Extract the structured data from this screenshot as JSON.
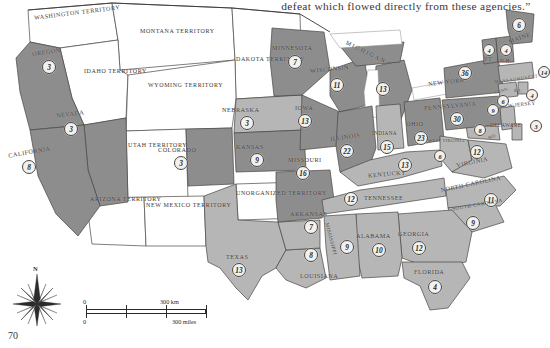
{
  "page": {
    "folio": "70",
    "quote": "defeat which flowed directly from these agencies.”"
  },
  "legend": {
    "compass_north": "N",
    "scale": {
      "km_zero": "0",
      "km_label": "300 km",
      "mi_zero": "0",
      "mi_label": "300 miles"
    }
  },
  "colors": {
    "union_dark": "#8d8d8d",
    "union_light": "#b6b6b6",
    "territory": "#ffffff",
    "border": "#4a4642",
    "water": "#ffffff",
    "circle_fill": "#f2f1ee",
    "text": "#3b3733"
  },
  "territories": [
    {
      "name": "WASHINGTON TERRITORY"
    },
    {
      "name": "MONTANA TERRITORY"
    },
    {
      "name": "DAKOTA TERRITORY"
    },
    {
      "name": "IDAHO TERRITORY"
    },
    {
      "name": "WYOMING TERRITORY"
    },
    {
      "name": "UTAH TERRITORY"
    },
    {
      "name": "ARIZONA TERRITORY"
    },
    {
      "name": "NEW MEXICO TERRITORY"
    },
    {
      "name": "UNORGANIZED TERRITORY"
    }
  ],
  "states": [
    {
      "name": "OREGON",
      "votes": "3"
    },
    {
      "name": "NEVADA",
      "votes": "3"
    },
    {
      "name": "CALIFORNIA",
      "votes": "8"
    },
    {
      "name": "COLORADO",
      "votes": "3"
    },
    {
      "name": "NEBRASKA",
      "votes": "3"
    },
    {
      "name": "KANSAS",
      "votes": "9"
    },
    {
      "name": "TEXAS",
      "votes": "13"
    },
    {
      "name": "MINNESOTA",
      "votes": "7"
    },
    {
      "name": "WISCONSIN",
      "votes": "11"
    },
    {
      "name": "MICHIGAN",
      "votes": "13"
    },
    {
      "name": "IOWA",
      "votes": "13"
    },
    {
      "name": "MISSOURI",
      "votes": "16"
    },
    {
      "name": "ARKANSAS",
      "votes": "7"
    },
    {
      "name": "LOUISIANA",
      "votes": "8"
    },
    {
      "name": "MISSISSIPPI",
      "votes": "9"
    },
    {
      "name": "ALABAMA",
      "votes": "10"
    },
    {
      "name": "GEORGIA",
      "votes": "12"
    },
    {
      "name": "FLORIDA",
      "votes": "4"
    },
    {
      "name": "TENNESSEE",
      "votes": "12"
    },
    {
      "name": "KENTUCKY",
      "votes": "13"
    },
    {
      "name": "ILLINOIS",
      "votes": "22"
    },
    {
      "name": "INDIANA",
      "votes": "15"
    },
    {
      "name": "OHIO",
      "votes": "23"
    },
    {
      "name": "WEST VIRGINIA",
      "votes": "6"
    },
    {
      "name": "VIRGINIA",
      "votes": "12"
    },
    {
      "name": "NORTH CAROLINA",
      "votes": "11"
    },
    {
      "name": "SOUTH CAROLINA",
      "votes": "9"
    },
    {
      "name": "PENNSYLVANIA",
      "votes": "30"
    },
    {
      "name": "NEW YORK",
      "votes": "36"
    },
    {
      "name": "MD",
      "votes": "8"
    },
    {
      "name": "DELAWARE",
      "votes": "3"
    },
    {
      "name": "NEW JERSEY",
      "votes": "9"
    },
    {
      "name": "CONN.",
      "votes": "6"
    },
    {
      "name": "R.I.",
      "votes": "4"
    },
    {
      "name": "MASSACHUSETTS",
      "votes": "14"
    },
    {
      "name": "VT",
      "votes": "4"
    },
    {
      "name": "N.H.",
      "votes": "4"
    },
    {
      "name": "MAINE",
      "votes": "6"
    }
  ]
}
